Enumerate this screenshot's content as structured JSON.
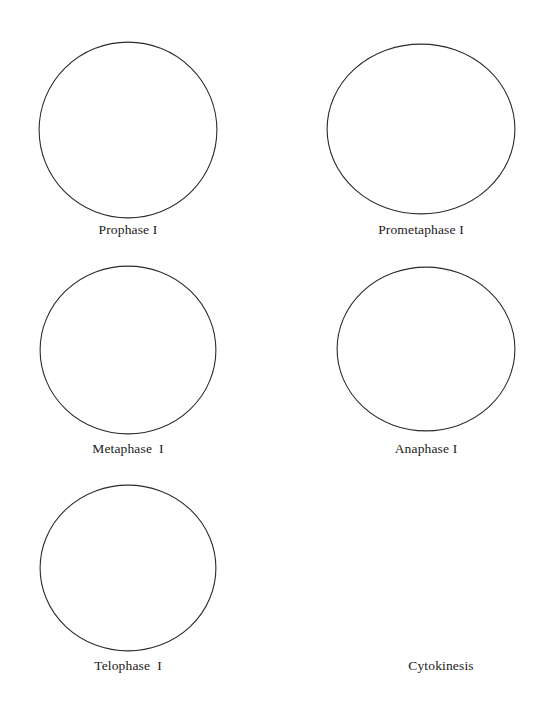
{
  "worksheet": {
    "title": "Meiosis Phases Worksheet",
    "background_color": "#ffffff",
    "ink_color": "#1a1a1a",
    "circle_stroke_color": "#2b2b2b",
    "circle_stroke_width": 1.1
  },
  "cells": [
    {
      "id": "prophase-1",
      "label": "Prophase I",
      "has_circle": true,
      "circle": {
        "cx": 128,
        "cy": 130,
        "rx": 90,
        "ry": 89
      },
      "label_box": {
        "left": 28,
        "top": 222,
        "width": 200
      }
    },
    {
      "id": "prometaphase-1",
      "label": "Prometaphase I",
      "has_circle": true,
      "circle": {
        "cx": 421,
        "cy": 129,
        "rx": 95,
        "ry": 86
      },
      "label_box": {
        "left": 321,
        "top": 222,
        "width": 200
      }
    },
    {
      "id": "metaphase-1",
      "label": "Metaphase  I",
      "has_circle": true,
      "circle": {
        "cx": 128,
        "cy": 350,
        "rx": 89,
        "ry": 85
      },
      "label_box": {
        "left": 28,
        "top": 441,
        "width": 200
      }
    },
    {
      "id": "anaphase-1",
      "label": "Anaphase I",
      "has_circle": true,
      "circle": {
        "cx": 426,
        "cy": 349,
        "rx": 90,
        "ry": 83
      },
      "label_box": {
        "left": 326,
        "top": 441,
        "width": 200
      }
    },
    {
      "id": "telophase-1",
      "label": "Telophase  I",
      "has_circle": true,
      "circle": {
        "cx": 128,
        "cy": 568,
        "rx": 89,
        "ry": 84
      },
      "label_box": {
        "left": 28,
        "top": 658,
        "width": 200
      }
    },
    {
      "id": "cytokinesis",
      "label": "Cytokinesis",
      "has_circle": false,
      "circle": null,
      "label_box": {
        "left": 341,
        "top": 658,
        "width": 200
      }
    }
  ]
}
